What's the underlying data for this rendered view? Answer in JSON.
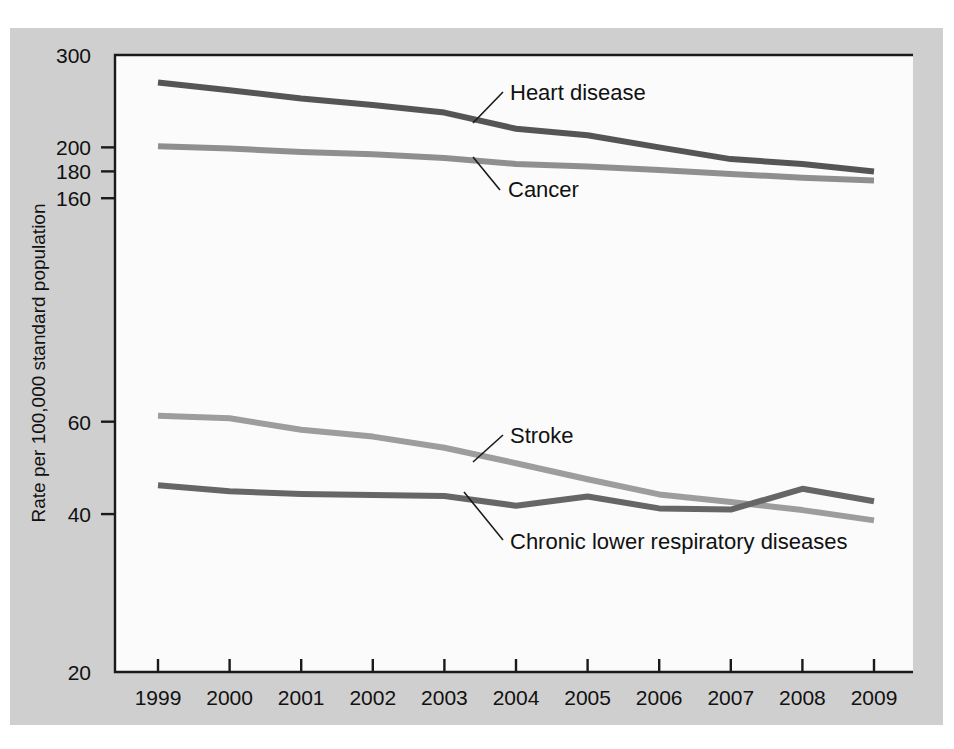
{
  "figure": {
    "background_color": "#ffffff",
    "panel_color": "#cfcfcf",
    "plot_color": "#fbfbfb"
  },
  "axis": {
    "y_title": "Rate per 100,000 standard population",
    "y_tick_labels": [
      "300",
      "200",
      "180",
      "160",
      "60",
      "40",
      "20"
    ],
    "x_tick_labels": [
      "1999",
      "2000",
      "2001",
      "2002",
      "2003",
      "2004",
      "2005",
      "2006",
      "2007",
      "2008",
      "2009"
    ]
  },
  "labels": {
    "heart": "Heart disease",
    "cancer": "Cancer",
    "stroke": "Stroke",
    "clrd": "Chronic lower respiratory diseases"
  },
  "chart_data": {
    "type": "line",
    "title": "",
    "subtitle": "",
    "xlabel": "",
    "ylabel": "Rate per 100,000 standard population",
    "x": [
      1999,
      2000,
      2001,
      2002,
      2003,
      2004,
      2005,
      2006,
      2007,
      2008,
      2009
    ],
    "categories": [
      "1999",
      "2000",
      "2001",
      "2002",
      "2003",
      "2004",
      "2005",
      "2006",
      "2007",
      "2008",
      "2009"
    ],
    "yscale": "log",
    "ylim": [
      20,
      300
    ],
    "yticks": [
      300,
      200,
      180,
      160,
      60,
      40,
      20
    ],
    "grid": false,
    "legend": "annotated-inline",
    "series": [
      {
        "name": "Heart disease",
        "color": "#555555",
        "values": [
          266,
          257,
          248,
          241,
          233,
          217,
          211,
          200,
          190,
          186,
          180
        ]
      },
      {
        "name": "Cancer",
        "color": "#8f8f8f",
        "values": [
          201,
          199,
          196,
          194,
          191,
          186,
          184,
          181,
          178,
          175,
          173
        ]
      },
      {
        "name": "Stroke",
        "color": "#9d9d9d",
        "values": [
          61.6,
          60.9,
          57.9,
          56.2,
          53.5,
          50.0,
          46.6,
          43.6,
          42.2,
          40.7,
          38.9
        ]
      },
      {
        "name": "Chronic lower respiratory diseases",
        "color": "#666666",
        "values": [
          45.4,
          44.2,
          43.7,
          43.5,
          43.3,
          41.5,
          43.2,
          41.0,
          40.8,
          44.7,
          42.3
        ]
      }
    ]
  }
}
